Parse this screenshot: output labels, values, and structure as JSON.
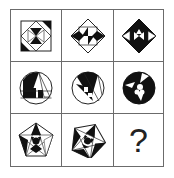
{
  "puzzle": {
    "layout": "3x3 grid",
    "rows": [
      {
        "shape": "square",
        "cells": [
          "square-pattern-1",
          "diamond-pattern-2",
          "diamond-filled-pattern-3"
        ]
      },
      {
        "shape": "circle",
        "cells": [
          "circle-pattern-1",
          "circle-pattern-2",
          "circle-filled-pattern-3"
        ]
      },
      {
        "shape": "pentagon",
        "cells": [
          "pentagon-pattern-1",
          "pentagon-rotated-pattern-2",
          "unknown"
        ]
      }
    ],
    "question_mark": "?"
  },
  "colors": {
    "line": "#6b6b6b",
    "fill": "#111111",
    "background": "#ffffff"
  }
}
